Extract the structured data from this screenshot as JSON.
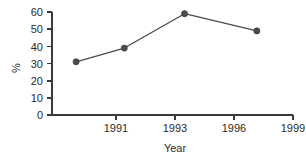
{
  "chart_data": {
    "type": "line",
    "title": "",
    "xlabel": "Year",
    "ylabel": "%",
    "xlim": [
      1989,
      1999
    ],
    "ylim": [
      0,
      60
    ],
    "grid": false,
    "legend": null,
    "x": [
      1990,
      1992,
      1994.5,
      1997.5
    ],
    "values": [
      31,
      39,
      59,
      49
    ],
    "series": [
      {
        "name": "percent",
        "x": [
          1990,
          1992,
          1994.5,
          1997.5
        ],
        "values": [
          31,
          39,
          59,
          49
        ],
        "color": "#4a4a52",
        "marker": "circle"
      }
    ],
    "x_ticks": [
      1991,
      1993,
      1996,
      1999
    ],
    "x_tick_labels": [
      "1991",
      "1993",
      "1996",
      "1999"
    ],
    "y_ticks": [
      0,
      10,
      20,
      30,
      40,
      50,
      60
    ],
    "y_tick_labels": [
      "0",
      "10",
      "20",
      "30",
      "40",
      "50",
      "60"
    ],
    "line_color": "#4a4a52",
    "axis_color": "#3a3a3a",
    "background": "#ffffff"
  },
  "axes": {
    "y_label": "%",
    "x_label": "Year"
  },
  "y_ticks": {
    "t0": "0",
    "t1": "10",
    "t2": "20",
    "t3": "30",
    "t4": "40",
    "t5": "50",
    "t6": "60"
  },
  "x_ticks": {
    "t0": "1991",
    "t1": "1993",
    "t2": "1996",
    "t3": "1999"
  }
}
